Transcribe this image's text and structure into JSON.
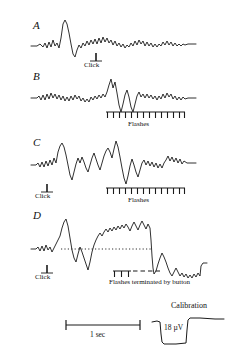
{
  "figure": {
    "type": "eeg-evoked-potential-traces",
    "background_color": "#ffffff",
    "trace_color": "#1a1a1a",
    "rows": [
      {
        "letter": "A",
        "letter_x": 33,
        "letter_y": 26,
        "baseline_y": 44,
        "markers": [
          {
            "kind": "click",
            "label": "Click",
            "x": 96,
            "y": 54,
            "label_x": 84,
            "label_y": 68
          }
        ]
      },
      {
        "letter": "B",
        "letter_x": 33,
        "letter_y": 77,
        "baseline_y": 96,
        "markers": [
          {
            "kind": "flashes",
            "label": "Flashes",
            "x_start": 106,
            "x_end": 185,
            "y": 113,
            "ticks": 14,
            "label_x": 128,
            "label_y": 128
          }
        ]
      },
      {
        "letter": "C",
        "letter_x": 33,
        "letter_y": 143,
        "baseline_y": 163,
        "markers": [
          {
            "kind": "click",
            "label": "Click",
            "x": 47,
            "y": 185,
            "label_x": 35,
            "label_y": 199
          },
          {
            "kind": "flashes",
            "label": "Flashes",
            "x_start": 106,
            "x_end": 185,
            "y": 189,
            "ticks": 14,
            "label_x": 128,
            "label_y": 203
          }
        ]
      },
      {
        "letter": "D",
        "letter_x": 33,
        "letter_y": 216,
        "baseline_y": 245,
        "dotted_baseline": {
          "x_start": 61,
          "x_end": 151,
          "y": 249
        },
        "markers": [
          {
            "kind": "flashes-terminated",
            "label": "Flashes terminated by button",
            "x_start": 113,
            "x_end": 160,
            "y": 271,
            "solid_ticks": 3,
            "dashes": 4,
            "label_x": 109,
            "label_y": 285
          }
        ],
        "click_marker": {
          "kind": "click",
          "label": "Click",
          "x": 47,
          "y": 266,
          "label_x": 35,
          "label_y": 280
        }
      }
    ],
    "time_scale": {
      "label": "1 sec",
      "x_start": 66,
      "x_end": 140,
      "y": 325,
      "label_x": 90,
      "label_y": 338
    },
    "calibration": {
      "title": "Calibration",
      "title_x": 171,
      "title_y": 309,
      "amplitude_label": "18 µV",
      "amplitude_label_x": 164,
      "amplitude_label_y": 330
    }
  }
}
